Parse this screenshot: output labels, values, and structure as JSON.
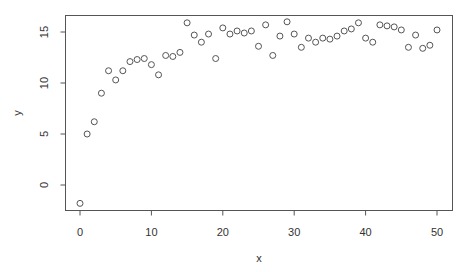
{
  "chart_data": {
    "type": "scatter",
    "title": "",
    "xlabel": "x",
    "ylabel": "y",
    "xlim": [
      -2,
      52
    ],
    "ylim": [
      -2.4,
      16.7
    ],
    "xticks": [
      0,
      10,
      20,
      30,
      40,
      50
    ],
    "yticks": [
      0,
      5,
      10,
      15
    ],
    "grid": false,
    "legend": null,
    "marker": "open-circle",
    "marker_color": "#555555",
    "x": [
      0,
      1,
      2,
      3,
      4,
      5,
      6,
      7,
      8,
      9,
      10,
      11,
      12,
      13,
      14,
      15,
      16,
      17,
      18,
      19,
      20,
      21,
      22,
      23,
      24,
      25,
      26,
      27,
      28,
      29,
      30,
      31,
      32,
      33,
      34,
      35,
      36,
      37,
      38,
      39,
      40,
      41,
      42,
      43,
      44,
      45,
      46,
      47,
      48,
      49,
      50
    ],
    "y": [
      -1.8,
      5.0,
      6.2,
      9.0,
      11.2,
      10.3,
      11.2,
      12.1,
      12.3,
      12.4,
      11.8,
      10.8,
      12.7,
      12.6,
      13.0,
      15.9,
      14.7,
      14.0,
      14.8,
      12.4,
      15.4,
      14.8,
      15.1,
      14.9,
      15.1,
      13.6,
      15.7,
      12.7,
      14.6,
      16.0,
      14.8,
      13.5,
      14.4,
      14.0,
      14.4,
      14.3,
      14.6,
      15.1,
      15.3,
      15.9,
      14.4,
      14.0,
      15.7,
      15.6,
      15.5,
      15.2,
      13.5,
      14.7,
      13.4,
      13.7,
      15.2
    ]
  },
  "axes": {
    "xlabel": "x",
    "ylabel": "y",
    "xtick_labels": [
      "0",
      "10",
      "20",
      "30",
      "40",
      "50"
    ],
    "ytick_labels": [
      "0",
      "5",
      "10",
      "15"
    ]
  }
}
